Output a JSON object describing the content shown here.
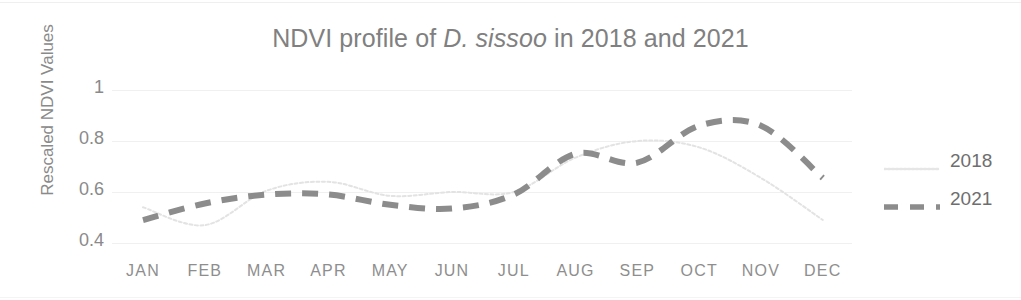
{
  "chart_data": {
    "type": "line",
    "title_prefix": "NDVI profile of ",
    "title_species": "D. sissoo",
    "title_suffix": " in 2018 and 2021",
    "title": "NDVI profile of D. sissoo in 2018 and 2021",
    "xlabel": "",
    "ylabel": "Rescaled NDVI Values",
    "categories": [
      "JAN",
      "FEB",
      "MAR",
      "APR",
      "MAY",
      "JUN",
      "JUL",
      "AUG",
      "SEP",
      "OCT",
      "NOV",
      "DEC"
    ],
    "ylim": [
      0.4,
      1.0
    ],
    "ytick_labels": [
      "0.4",
      "0.6",
      "0.8",
      "1"
    ],
    "ytick_values": [
      0.4,
      0.6,
      0.8,
      1.0
    ],
    "grid": true,
    "legend_position": "right",
    "series": [
      {
        "name": "2018",
        "color": "#e3e3e3",
        "style": "dotted-thin",
        "values": [
          0.54,
          0.47,
          0.605,
          0.64,
          0.585,
          0.6,
          0.6,
          0.735,
          0.8,
          0.775,
          0.655,
          0.49
        ]
      },
      {
        "name": "2021",
        "color": "#8c8c8c",
        "style": "dashed-thick",
        "values": [
          0.49,
          0.555,
          0.59,
          0.59,
          0.55,
          0.535,
          0.59,
          0.75,
          0.715,
          0.86,
          0.86,
          0.655
        ]
      }
    ]
  },
  "legend": {
    "items": [
      {
        "label": "2018",
        "color": "#e3e3e3"
      },
      {
        "label": "2021",
        "color": "#8c8c8c"
      }
    ]
  },
  "axis_colors": {
    "gridline": "#f0f0f0",
    "tick_text": "#8a8a8a",
    "title_text": "#808080"
  }
}
